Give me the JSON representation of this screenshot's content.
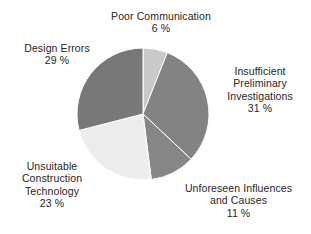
{
  "chart_data": {
    "type": "pie",
    "title": "",
    "subtitle": "",
    "xlabel": "",
    "ylabel": "",
    "legend_position": "none",
    "grid": false,
    "units": "%",
    "start_angle_deg": 0,
    "direction": "clockwise",
    "center": {
      "x": 143,
      "y": 114
    },
    "radius": 66,
    "background_color": "#ffffff",
    "slice_divider_color": "#ffffff",
    "categories": [
      "Poor Communication",
      "Insufficient Preliminary Investigations",
      "Unforeseen Influences and Causes",
      "Unsuitable Construction Technology",
      "Design Errors"
    ],
    "values": [
      6,
      31,
      11,
      23,
      29
    ],
    "slices": [
      {
        "key": "poor-communication",
        "name": "Poor Communication",
        "value": 6,
        "value_text": "6 %",
        "color": "#c9c9c9",
        "label_lines": [
          "Poor Communication"
        ]
      },
      {
        "key": "insufficient-preliminary-investigations",
        "name": "Insufficient Preliminary Investigations",
        "value": 31,
        "value_text": "31 %",
        "color": "#838383",
        "label_lines": [
          "Insufficient",
          "Preliminary",
          "Investigations"
        ]
      },
      {
        "key": "unforeseen-influences-and-causes",
        "name": "Unforeseen Influences and Causes",
        "value": 11,
        "value_text": "11 %",
        "color": "#868686",
        "label_lines": [
          "Unforeseen Influences",
          "and Causes"
        ]
      },
      {
        "key": "unsuitable-construction-technology",
        "name": "Unsuitable Construction Technology",
        "value": 23,
        "value_text": "23 %",
        "color": "#ededed",
        "label_lines": [
          "Unsuitable",
          "Construction",
          "Technology"
        ]
      },
      {
        "key": "design-errors",
        "name": "Design Errors",
        "value": 29,
        "value_text": "29 %",
        "color": "#787878",
        "label_lines": [
          "Design Errors"
        ]
      }
    ]
  },
  "labels": {
    "poor_communication": {
      "line1": "Poor Communication",
      "pct": "6 %"
    },
    "design_errors": {
      "line1": "Design Errors",
      "pct": "29 %"
    },
    "insufficient": {
      "line1": "Insufficient",
      "line2": "Preliminary",
      "line3": "Investigations",
      "pct": "31 %"
    },
    "unsuitable": {
      "line1": "Unsuitable",
      "line2": "Construction",
      "line3": "Technology",
      "pct": "23 %"
    },
    "unforeseen": {
      "line1": "Unforeseen Influences",
      "line2": "and Causes",
      "pct": "11 %"
    }
  }
}
